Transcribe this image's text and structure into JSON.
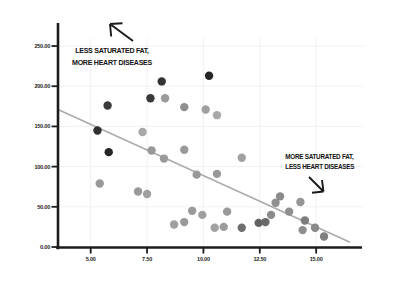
{
  "chart_data": {
    "type": "scatter",
    "title": "",
    "xlabel": "",
    "ylabel": "",
    "grid": "on",
    "x_axis": {
      "min": 3.55,
      "max": 16.9,
      "tick_values": [
        5,
        7.5,
        10,
        12.5,
        15
      ],
      "tick_labels": [
        "5.00",
        "7.50",
        "10.00",
        "12.50",
        "15.00"
      ]
    },
    "y_axis": {
      "min": 0,
      "max": 260,
      "tick_values": [
        0,
        50,
        100,
        150,
        200,
        250
      ],
      "tick_labels": [
        "0.00",
        "50.00",
        "100.00",
        "150.00",
        "200.00",
        "250.00"
      ]
    },
    "trendline": {
      "x1": 3.55,
      "y1": 171,
      "x2": 16.5,
      "y2": 6
    },
    "annotations": [
      {
        "id": "upper-left",
        "lines": [
          "LESS SATURATED FAT,",
          "MORE HEART DISEASES"
        ],
        "arrow": "up-left"
      },
      {
        "id": "lower-right",
        "lines": [
          "MORE SATURATED FAT,",
          "LESS HEART DISEASES"
        ],
        "arrow": "down-right"
      }
    ],
    "points": [
      {
        "x": 5.3,
        "y": 145,
        "color": "#2f2f2f"
      },
      {
        "x": 5.75,
        "y": 176,
        "color": "#3a3a3a"
      },
      {
        "x": 5.8,
        "y": 118,
        "color": "#262626"
      },
      {
        "x": 7.65,
        "y": 185,
        "color": "#383838"
      },
      {
        "x": 8.15,
        "y": 206,
        "color": "#333333"
      },
      {
        "x": 10.25,
        "y": 213,
        "color": "#262626"
      },
      {
        "x": 7.3,
        "y": 143,
        "color": "#a8a8a8"
      },
      {
        "x": 8.3,
        "y": 185,
        "color": "#9a9a9a"
      },
      {
        "x": 9.15,
        "y": 174,
        "color": "#8f8f8f"
      },
      {
        "x": 10.1,
        "y": 171,
        "color": "#a0a0a0"
      },
      {
        "x": 10.6,
        "y": 164,
        "color": "#a8a8a8"
      },
      {
        "x": 5.4,
        "y": 79,
        "color": "#9a9a9a"
      },
      {
        "x": 7.1,
        "y": 69,
        "color": "#9a9a9a"
      },
      {
        "x": 7.5,
        "y": 66,
        "color": "#a0a0a0"
      },
      {
        "x": 7.7,
        "y": 120,
        "color": "#999999"
      },
      {
        "x": 8.25,
        "y": 110,
        "color": "#9a9a9a"
      },
      {
        "x": 9.15,
        "y": 121,
        "color": "#999999"
      },
      {
        "x": 9.7,
        "y": 90,
        "color": "#999999"
      },
      {
        "x": 10.6,
        "y": 91,
        "color": "#999999"
      },
      {
        "x": 11.7,
        "y": 111,
        "color": "#a0a0a0"
      },
      {
        "x": 8.7,
        "y": 28,
        "color": "#a0a0a0"
      },
      {
        "x": 9.15,
        "y": 31,
        "color": "#999999"
      },
      {
        "x": 9.5,
        "y": 45,
        "color": "#999999"
      },
      {
        "x": 9.95,
        "y": 40,
        "color": "#9f9f9f"
      },
      {
        "x": 10.5,
        "y": 24,
        "color": "#a2a2a2"
      },
      {
        "x": 10.9,
        "y": 25,
        "color": "#9c9c9c"
      },
      {
        "x": 11.05,
        "y": 44,
        "color": "#999999"
      },
      {
        "x": 11.7,
        "y": 24,
        "color": "#6e6e6e"
      },
      {
        "x": 12.45,
        "y": 30,
        "color": "#636363"
      },
      {
        "x": 12.75,
        "y": 31,
        "color": "#6a6a6a"
      },
      {
        "x": 13.0,
        "y": 40,
        "color": "#8a8a8a"
      },
      {
        "x": 13.2,
        "y": 55,
        "color": "#8f8f8f"
      },
      {
        "x": 13.4,
        "y": 63,
        "color": "#8a8a8a"
      },
      {
        "x": 13.8,
        "y": 44,
        "color": "#8f8f8f"
      },
      {
        "x": 14.3,
        "y": 56,
        "color": "#959595"
      },
      {
        "x": 14.5,
        "y": 33,
        "color": "#7d7d7d"
      },
      {
        "x": 14.4,
        "y": 21,
        "color": "#8f8f8f"
      },
      {
        "x": 14.95,
        "y": 24,
        "color": "#8a8a8a"
      },
      {
        "x": 15.35,
        "y": 13,
        "color": "#808080"
      }
    ]
  },
  "colors": {
    "background": "#ffffff",
    "axis": "#1c1c1c",
    "grid": "#f1f1f1",
    "trendline": "#ababab",
    "tick_label": "#222222",
    "annotation_text": "#111111",
    "arrow": "#1a1a1a"
  }
}
